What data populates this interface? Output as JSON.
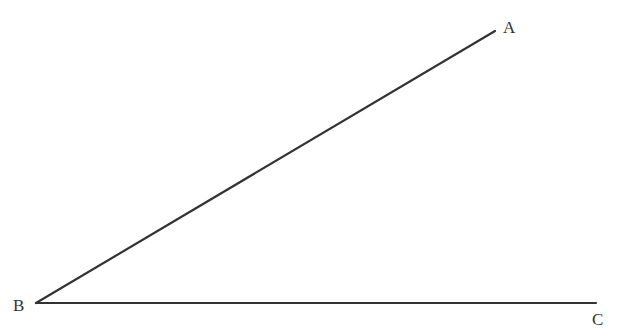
{
  "diagram": {
    "type": "angle",
    "stroke_color": "#333333",
    "points": {
      "A": {
        "label": "A",
        "x": 495,
        "y": 31
      },
      "B": {
        "label": "B",
        "x": 36,
        "y": 303
      },
      "C": {
        "label": "C",
        "x": 596,
        "y": 303
      }
    },
    "segments": [
      {
        "from": "B",
        "to": "A"
      },
      {
        "from": "B",
        "to": "C"
      }
    ]
  }
}
